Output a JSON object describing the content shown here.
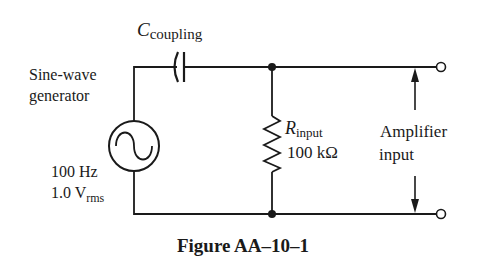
{
  "figure": {
    "caption": "Figure AA–10–1"
  },
  "generator": {
    "label_line1": "Sine-wave",
    "label_line2": "generator",
    "frequency": "100 Hz",
    "voltage_main": "1.0 V",
    "voltage_sub": "rms"
  },
  "capacitor": {
    "symbol": "C",
    "subscript": "coupling"
  },
  "resistor": {
    "symbol": "R",
    "subscript": "input",
    "value": "100 kΩ"
  },
  "amplifier": {
    "label_line1": "Amplifier",
    "label_line2": "input"
  },
  "colors": {
    "ink": "#1a1a1a",
    "background": "#ffffff"
  }
}
